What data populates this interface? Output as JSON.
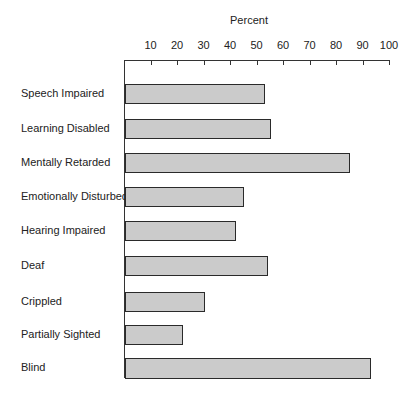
{
  "chart_data": {
    "type": "bar",
    "orientation": "horizontal",
    "title": "",
    "xlabel": "Percent",
    "ylabel": "",
    "xlim": [
      0,
      100
    ],
    "x_ticks": [
      10,
      20,
      30,
      40,
      50,
      60,
      70,
      80,
      90,
      100
    ],
    "x_axis_position": "top",
    "grid": false,
    "legend": null,
    "bar_color": "#cbcbcb",
    "categories": [
      "Speech Impaired",
      "Learning Disabled",
      "Mentally Retarded",
      "Emotionally Disturbed",
      "Hearing Impaired",
      "Deaf",
      "Crippled",
      "Partially Sighted",
      "Blind"
    ],
    "values": [
      53,
      55,
      85,
      45,
      42,
      54,
      30,
      22,
      93
    ]
  },
  "axis": {
    "label": "Percent",
    "ticks": [
      "10",
      "20",
      "30",
      "40",
      "50",
      "60",
      "70",
      "80",
      "90",
      "100"
    ]
  },
  "rows": [
    {
      "label": "Speech Impaired",
      "value": 53
    },
    {
      "label": "Learning Disabled",
      "value": 55
    },
    {
      "label": "Mentally Retarded",
      "value": 85
    },
    {
      "label": "Emotionally Disturbed",
      "value": 45
    },
    {
      "label": "Hearing Impaired",
      "value": 42
    },
    {
      "label": "Deaf",
      "value": 54
    },
    {
      "label": "Crippled",
      "value": 30
    },
    {
      "label": "Partially Sighted",
      "value": 22
    },
    {
      "label": "Blind",
      "value": 93
    }
  ]
}
